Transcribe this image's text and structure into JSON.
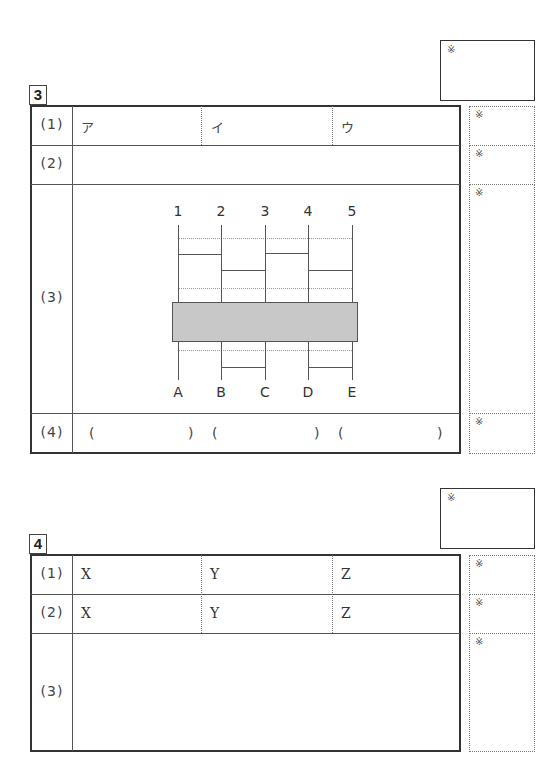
{
  "mark_symbol": "※",
  "q3": {
    "number": "3",
    "rows": [
      {
        "label": "(1)",
        "cells": [
          "ア",
          "イ",
          "ウ"
        ]
      },
      {
        "label": "(2)"
      },
      {
        "label": "(3)"
      },
      {
        "label": "(4)",
        "parens": [
          "(",
          ")",
          "(",
          ")",
          "(",
          ")"
        ]
      }
    ],
    "diagram": {
      "top_labels": [
        "1",
        "2",
        "3",
        "4",
        "5"
      ],
      "bottom_labels": [
        "A",
        "B",
        "C",
        "D",
        "E"
      ]
    }
  },
  "q4": {
    "number": "4",
    "rows": [
      {
        "label": "(1)",
        "cells": [
          "X",
          "Y",
          "Z"
        ]
      },
      {
        "label": "(2)",
        "cells": [
          "X",
          "Y",
          "Z"
        ]
      },
      {
        "label": "(3)"
      }
    ]
  }
}
